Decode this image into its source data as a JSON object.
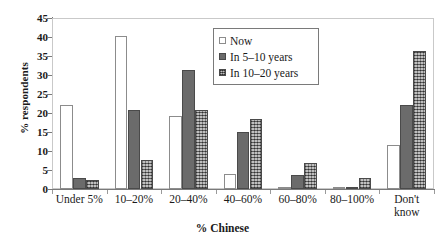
{
  "chart_data": {
    "type": "bar",
    "title": "",
    "xlabel": "% Chinese",
    "ylabel": "% respondents",
    "ylim": [
      0,
      45
    ],
    "ytick_step": 5,
    "yticks": [
      0,
      5,
      10,
      15,
      20,
      25,
      30,
      35,
      40,
      45
    ],
    "ytick_labels": [
      "0",
      "5",
      "10",
      "15",
      "20",
      "25",
      "30",
      "35",
      "40",
      "45"
    ],
    "grid": false,
    "legend_position": "upper-center",
    "categories": [
      "Under 5%",
      "10–20%",
      "20–40%",
      "40–60%",
      "60–80%",
      "80–100%",
      "Don't know"
    ],
    "category_lines": [
      [
        "Under 5%"
      ],
      [
        "10–20%"
      ],
      [
        "20–40%"
      ],
      [
        "40–60%"
      ],
      [
        "60–80%"
      ],
      [
        "80–100%"
      ],
      [
        "Don't",
        "know"
      ]
    ],
    "series": [
      {
        "name": "Now",
        "fill": "white",
        "color": "#ffffff",
        "values": [
          22.1,
          40.3,
          19.2,
          4.0,
          0.3,
          0.1,
          11.5
        ]
      },
      {
        "name": "In 5–10 years",
        "fill": "solid-dark-gray",
        "color": "#6b6b6b",
        "values": [
          2.8,
          20.8,
          31.2,
          14.9,
          3.6,
          0.4,
          22.1
        ]
      },
      {
        "name": "In 10–20 years",
        "fill": "cross-hatch-gray",
        "color": "#7d7d7d",
        "values": [
          2.3,
          7.7,
          20.7,
          18.3,
          6.9,
          2.9,
          36.4
        ]
      }
    ]
  },
  "legend": {
    "items": [
      {
        "label": "Now"
      },
      {
        "label": "In 5–10 years"
      },
      {
        "label": "In 10–20 years"
      }
    ]
  }
}
